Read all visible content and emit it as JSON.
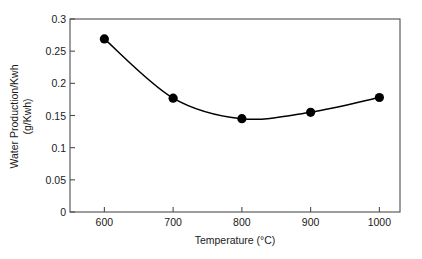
{
  "chart_data": {
    "type": "line",
    "title": "",
    "subtitle": "",
    "xlabel": "Temperature (°C)",
    "ylabel_line1": "Water Production/Kwh",
    "ylabel_line2": "(g/Kwh)",
    "x": [
      600,
      700,
      800,
      900,
      1000
    ],
    "categories": [
      "600",
      "700",
      "800",
      "900",
      "1000"
    ],
    "values": [
      0.269,
      0.177,
      0.145,
      0.155,
      0.178
    ],
    "series": [
      {
        "name": "Water Production/Kwh",
        "values": [
          0.269,
          0.177,
          0.145,
          0.155,
          0.178
        ]
      }
    ],
    "xlim": [
      550,
      1030
    ],
    "ylim": [
      0,
      0.3
    ],
    "xticks": [
      600,
      700,
      800,
      900,
      1000
    ],
    "xtick_labels": [
      "600",
      "700",
      "800",
      "900",
      "1000"
    ],
    "yticks": [
      0,
      0.05,
      0.1,
      0.15,
      0.2,
      0.25,
      0.3
    ],
    "ytick_labels": [
      "0",
      "0.05",
      "0.1",
      "0.15",
      "0.2",
      "0.25",
      "0.3"
    ],
    "grid": false,
    "legend": false,
    "legend_position": "none",
    "marker": "filled-circle",
    "marker_color": "#000000",
    "line_color": "#000000",
    "line_style": "smooth",
    "plot_background": "#ffffff",
    "axis_color": "#4d4d4d",
    "text_color": "#1a1a1a",
    "annotations": []
  }
}
